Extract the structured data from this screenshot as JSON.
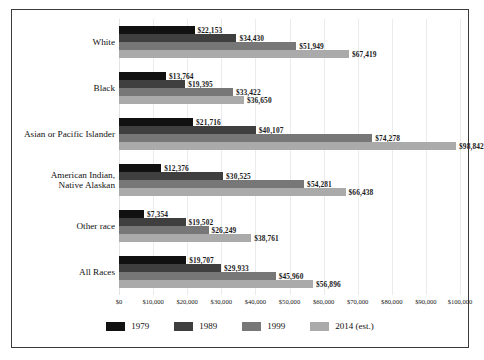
{
  "chart_data": {
    "type": "bar",
    "orientation": "horizontal",
    "title": "",
    "xlabel": "",
    "ylabel": "",
    "xlim": [
      0,
      100000
    ],
    "grid": true,
    "legend_position": "bottom",
    "categories": [
      "White",
      "Black",
      "Asian or Pacific Islander",
      "American Indian,\nNative Alaskan",
      "Other race",
      "All Races"
    ],
    "category_lines": [
      [
        "White"
      ],
      [
        "Black"
      ],
      [
        "Asian or Pacific Islander"
      ],
      [
        "American Indian,",
        "Native Alaskan"
      ],
      [
        "Other race"
      ],
      [
        "All Races"
      ]
    ],
    "series": [
      {
        "name": "1979",
        "color": "#111111",
        "values": [
          22153,
          13764,
          21716,
          12376,
          7354,
          19707
        ],
        "labels": [
          "$22,153",
          "$13,764",
          "$21,716",
          "$12,376",
          "$7,354",
          "$19,707"
        ]
      },
      {
        "name": "1989",
        "color": "#3f3f3f",
        "values": [
          34430,
          19395,
          40107,
          30525,
          19502,
          29933
        ],
        "labels": [
          "$34,430",
          "$19,395",
          "$40,107",
          "$30,525",
          "$19,502",
          "$29,933"
        ]
      },
      {
        "name": "1999",
        "color": "#777777",
        "values": [
          51949,
          33422,
          74278,
          54281,
          26249,
          45960
        ],
        "labels": [
          "$51,949",
          "$33,422",
          "$74,278",
          "$54,281",
          "$26,249",
          "$45,960"
        ]
      },
      {
        "name": "2014 (est.)",
        "color": "#aaaaaa",
        "values": [
          67419,
          36650,
          98842,
          66438,
          38761,
          56896
        ],
        "labels": [
          "$67,419",
          "$36,650",
          "$98,842",
          "$66,438",
          "$38,761",
          "$56,896"
        ]
      }
    ],
    "xticks": [
      0,
      10000,
      20000,
      30000,
      40000,
      50000,
      60000,
      70000,
      80000,
      90000,
      100000
    ],
    "xtick_labels": [
      "$0",
      "$10,000",
      "$20,000",
      "$30,000",
      "$40,000",
      "$50,000",
      "$60,000",
      "$70,000",
      "$80,000",
      "$90,000",
      "$100,000"
    ]
  },
  "legend": {
    "items": [
      {
        "label": "1979"
      },
      {
        "label": "1989"
      },
      {
        "label": "1999"
      },
      {
        "label": "2014 (est.)"
      }
    ]
  }
}
